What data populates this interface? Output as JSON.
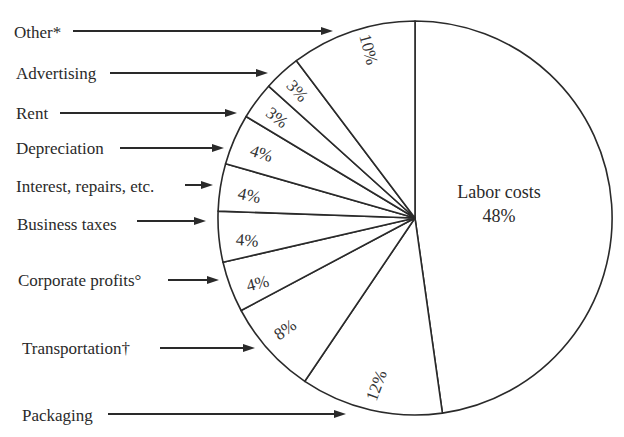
{
  "chart_data": {
    "type": "pie",
    "title": "",
    "unit": "%",
    "categories": [
      "Labor costs",
      "Packaging",
      "Transportation†",
      "Corporate profits°",
      "Business taxes",
      "Interest, repairs, etc.",
      "Depreciation",
      "Rent",
      "Advertising",
      "Other*"
    ],
    "values": [
      48,
      12,
      8,
      4,
      4,
      4,
      4,
      3,
      3,
      10
    ],
    "labels_pct": [
      "48%",
      "12%",
      "8%",
      "4%",
      "4%",
      "4%",
      "4%",
      "3%",
      "3%",
      "10%"
    ],
    "legend_position": "left (arrow callouts)",
    "center_label": {
      "name": "Labor costs",
      "value": "48%"
    }
  },
  "geometry": {
    "cx": 415,
    "cy": 218,
    "r": 197,
    "boundaries_deg": [
      -90,
      82,
      124,
      152,
      167,
      182,
      196,
      211,
      222,
      233,
      270
    ]
  },
  "callouts": [
    {
      "label": "Other*",
      "tx": 14,
      "ty": 38,
      "x1": 73,
      "x2": 333,
      "y": 31
    },
    {
      "label": "Advertising",
      "tx": 16,
      "ty": 79,
      "x1": 110,
      "x2": 268,
      "y": 73
    },
    {
      "label": "Rent",
      "tx": 16,
      "ty": 119,
      "x1": 60,
      "x2": 237,
      "y": 113
    },
    {
      "label": "Depreciation",
      "tx": 16,
      "ty": 154,
      "x1": 120,
      "x2": 224,
      "y": 148
    },
    {
      "label": "Interest, repairs, etc.",
      "tx": 16,
      "ty": 192,
      "x1": 185,
      "x2": 213,
      "y": 185
    },
    {
      "label": "Business taxes",
      "tx": 17,
      "ty": 230,
      "x1": 137,
      "x2": 206,
      "y": 221
    },
    {
      "label": "Corporate profits°",
      "tx": 18,
      "ty": 286,
      "x1": 168,
      "x2": 219,
      "y": 280
    },
    {
      "label": "Transportation†",
      "tx": 22,
      "ty": 354,
      "x1": 160,
      "x2": 255,
      "y": 348
    },
    {
      "label": "Packaging",
      "tx": 22,
      "ty": 421,
      "x1": 108,
      "x2": 346,
      "y": 414
    }
  ],
  "slice_labels": [
    {
      "text": "10%",
      "x": 367,
      "y": 50,
      "rot": 75
    },
    {
      "text": "3%",
      "x": 296,
      "y": 92,
      "rot": 48
    },
    {
      "text": "3%",
      "x": 276,
      "y": 119,
      "rot": 38
    },
    {
      "text": "4%",
      "x": 261,
      "y": 155,
      "rot": 18
    },
    {
      "text": "4%",
      "x": 249,
      "y": 197,
      "rot": 12
    },
    {
      "text": "4%",
      "x": 247,
      "y": 242,
      "rot": 4
    },
    {
      "text": "4%",
      "x": 258,
      "y": 285,
      "rot": -14
    },
    {
      "text": "8%",
      "x": 286,
      "y": 331,
      "rot": -35
    },
    {
      "text": "12%",
      "x": 378,
      "y": 386,
      "rot": -70
    }
  ],
  "colors": {
    "line": "#2a2a2a",
    "fill": "#ffffff",
    "text": "#2a2a2a"
  }
}
